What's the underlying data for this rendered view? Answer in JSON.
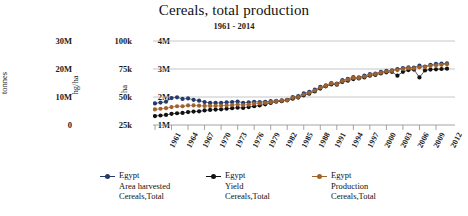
{
  "chart_data": {
    "type": "line",
    "title": "Cereals, total production",
    "subtitle": "1961 - 2014",
    "xlabel": "",
    "grid": true,
    "legend_position": "bottom",
    "x": [
      1961,
      1962,
      1963,
      1964,
      1965,
      1966,
      1967,
      1968,
      1969,
      1970,
      1971,
      1972,
      1973,
      1974,
      1975,
      1976,
      1977,
      1978,
      1979,
      1980,
      1981,
      1982,
      1983,
      1984,
      1985,
      1986,
      1987,
      1988,
      1989,
      1990,
      1991,
      1992,
      1993,
      1994,
      1995,
      1996,
      1997,
      1998,
      1999,
      2000,
      2001,
      2002,
      2003,
      2004,
      2005,
      2006,
      2007,
      2008,
      2009,
      2010,
      2011,
      2012,
      2013,
      2014
    ],
    "xtick_labels": [
      "1961",
      "1964",
      "1967",
      "1970",
      "1973",
      "1976",
      "1979",
      "1982",
      "1985",
      "1988",
      "1991",
      "1994",
      "1997",
      "2000",
      "2003",
      "2006",
      "2009",
      "2012"
    ],
    "axes": [
      {
        "name": "tonnes",
        "title": "tonnes",
        "ticks": [
          "30M",
          "20M",
          "10M",
          "0"
        ],
        "tick_values": [
          30000000,
          20000000,
          10000000,
          0
        ],
        "ylim": [
          0,
          40000000
        ]
      },
      {
        "name": "hg/ha",
        "title": "hg/ha",
        "ticks": [
          "100k",
          "75k",
          "50k",
          "25k"
        ],
        "tick_values": [
          100000,
          75000,
          50000,
          25000
        ],
        "ylim": [
          25000,
          125000
        ]
      },
      {
        "name": "ha",
        "title": "ha",
        "ticks": [
          "4M",
          "3M",
          "2M",
          "1M"
        ],
        "tick_values": [
          4000000,
          3000000,
          2000000,
          1000000
        ],
        "ylim": [
          1000000,
          5000000
        ]
      }
    ],
    "ylabel": "ha",
    "ylim": [
      1000000,
      5000000
    ],
    "series": [
      {
        "name": "Egypt Area harvested Cereals, Total",
        "country": "Egypt",
        "element": "Area harvested",
        "item": "Cereals,Total",
        "unit": "ha",
        "axis": "ha",
        "color": "#243a6b",
        "values": [
          1770000,
          1800000,
          1830000,
          1960000,
          1990000,
          1930000,
          1950000,
          1900000,
          1870000,
          1820000,
          1790000,
          1790000,
          1790000,
          1810000,
          1820000,
          1840000,
          1790000,
          1810000,
          1830000,
          1820000,
          1830000,
          1850000,
          1860000,
          1880000,
          1900000,
          2000000,
          2030000,
          2130000,
          2180000,
          2260000,
          2360000,
          2420000,
          2500000,
          2480000,
          2600000,
          2650000,
          2710000,
          2700000,
          2760000,
          2820000,
          2840000,
          2900000,
          2930000,
          2950000,
          3000000,
          3030000,
          3060000,
          3050000,
          3120000,
          3090000,
          3150000,
          3180000,
          3190000,
          3200000
        ]
      },
      {
        "name": "Egypt Yield Cereals, Total",
        "country": "Egypt",
        "element": "Yield",
        "item": "Cereals,Total",
        "unit": "hg/ha",
        "axis": "hg/ha",
        "color": "#111111",
        "values": [
          1320000,
          1340000,
          1360000,
          1400000,
          1420000,
          1430000,
          1460000,
          1480000,
          1490000,
          1520000,
          1540000,
          1550000,
          1560000,
          1580000,
          1600000,
          1620000,
          1610000,
          1640000,
          1670000,
          1700000,
          1740000,
          1790000,
          1830000,
          1850000,
          1880000,
          1940000,
          1980000,
          2060000,
          2120000,
          2200000,
          2300000,
          2380000,
          2450000,
          2440000,
          2540000,
          2580000,
          2640000,
          2660000,
          2700000,
          2760000,
          2790000,
          2840000,
          2880000,
          2900000,
          2760000,
          2900000,
          2960000,
          2980000,
          2700000,
          2950000,
          2980000,
          2990000,
          3000000,
          3010000
        ]
      },
      {
        "name": "Egypt Production Cereals, Total",
        "country": "Egypt",
        "element": "Production",
        "item": "Cereals,Total",
        "unit": "tonnes",
        "axis": "tonnes",
        "color": "#a0622d",
        "values": [
          1560000,
          1580000,
          1600000,
          1640000,
          1670000,
          1670000,
          1700000,
          1700000,
          1690000,
          1680000,
          1680000,
          1680000,
          1690000,
          1700000,
          1710000,
          1730000,
          1710000,
          1730000,
          1760000,
          1770000,
          1790000,
          1820000,
          1850000,
          1870000,
          1890000,
          1970000,
          2000000,
          2090000,
          2150000,
          2230000,
          2330000,
          2400000,
          2480000,
          2460000,
          2570000,
          2620000,
          2680000,
          2680000,
          2730000,
          2790000,
          2820000,
          2870000,
          2910000,
          2930000,
          2960000,
          3000000,
          3030000,
          3020000,
          3060000,
          3070000,
          3110000,
          3130000,
          3150000,
          3170000
        ]
      }
    ]
  },
  "legend": {
    "entries": [
      {
        "country": "Egypt",
        "element": "Area harvested",
        "item": "Cereals,Total",
        "color": "#243a6b"
      },
      {
        "country": "Egypt",
        "element": "Yield",
        "item": "Cereals,Total",
        "color": "#111111"
      },
      {
        "country": "Egypt",
        "element": "Production",
        "item": "Cereals,Total",
        "color": "#a0622d"
      }
    ]
  },
  "colors": {
    "grid": "#b8b8b8",
    "axis": "#9a9a9a",
    "text": "#1a1a1a",
    "background": "#ffffff"
  }
}
